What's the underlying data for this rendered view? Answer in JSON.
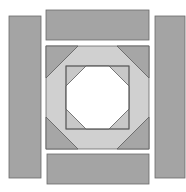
{
  "diagram": {
    "colors": {
      "background": "#ffffff",
      "strip": "#a4a4a4",
      "dark_corner": "#a6a6a6",
      "light_band": "#d0d0d0",
      "inner_corner": "#c4c4c4",
      "center": "#ffffff",
      "outline": "#5a5a5a"
    },
    "pieces": {
      "left_strip": {
        "x": 9,
        "y": 16,
        "w": 32,
        "h": 162
      },
      "right_strip": {
        "x": 155,
        "y": 16,
        "w": 30,
        "h": 162
      },
      "top_bar": {
        "x": 46,
        "y": 10,
        "w": 103,
        "h": 30
      },
      "bottom_bar": {
        "x": 47,
        "y": 154,
        "w": 102,
        "h": 30
      },
      "center_block": {
        "x": 46,
        "y": 46,
        "w": 103,
        "h": 103
      },
      "inner_square": {
        "x": 66,
        "y": 66,
        "w": 63,
        "h": 63
      },
      "corner_cut_outer": 32,
      "corner_cut_inner": 20
    }
  }
}
